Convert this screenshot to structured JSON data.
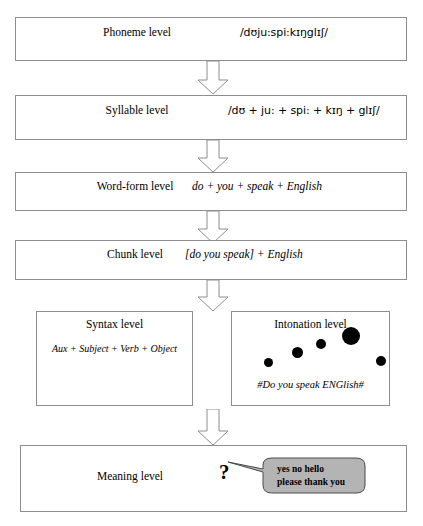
{
  "diagram": {
    "colors": {
      "box_border": "#8d8d8d",
      "arrow_outline": "#8d8d8d",
      "dot_fill": "#000000",
      "bubble_fill": "#b4b4b4",
      "bubble_border": "#4a4a4a",
      "background": "#ffffff"
    },
    "levels": [
      {
        "id": "phoneme",
        "label": "Phoneme level",
        "content": "/dʊju:spi:kɪŋglɪʃ/",
        "content_style": "ipa"
      },
      {
        "id": "syllable",
        "label": "Syllable level",
        "content": "/dʊ + ju: + spi: + kɪŋ + glɪʃ/",
        "content_style": "ipa"
      },
      {
        "id": "word-form",
        "label": "Word-form level",
        "content": "do + you + speak + English",
        "content_style": "italic"
      },
      {
        "id": "chunk",
        "label": "Chunk level",
        "content": "[do you speak] + English",
        "content_style": "italic"
      },
      {
        "id": "meaning",
        "label": "Meaning level",
        "content": "",
        "content_style": "none"
      }
    ],
    "syntax_box": {
      "title": "Syntax level",
      "body": "Aux + Subject + Verb + Object"
    },
    "intonation_box": {
      "title": "Intonation level",
      "caption": "#Do you speak ENGlish#",
      "dots": [
        {
          "x": 268,
          "y": 362,
          "r": 4.5
        },
        {
          "x": 297,
          "y": 352,
          "r": 5.5
        },
        {
          "x": 321,
          "y": 344,
          "r": 5.0
        },
        {
          "x": 351,
          "y": 336,
          "r": 9.0
        },
        {
          "x": 381,
          "y": 361,
          "r": 5.0
        }
      ]
    },
    "meaning_marker": {
      "symbol": "?"
    },
    "speech_bubble": {
      "line1": "yes no hello",
      "line2": "please thank you"
    },
    "arrows": [
      {
        "id": "arrow-phoneme-to-syllable",
        "from": "phoneme",
        "to": "syllable"
      },
      {
        "id": "arrow-syllable-to-wordform",
        "from": "syllable",
        "to": "word-form"
      },
      {
        "id": "arrow-wordform-to-chunk",
        "from": "word-form",
        "to": "chunk"
      },
      {
        "id": "arrow-chunk-to-syntax-intonation",
        "from": "chunk",
        "to": "syntax-intonation"
      },
      {
        "id": "arrow-syntax-intonation-to-meaning",
        "from": "syntax-intonation",
        "to": "meaning"
      }
    ]
  }
}
